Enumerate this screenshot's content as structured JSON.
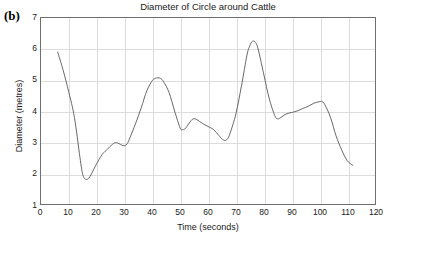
{
  "panel_label": "(b)",
  "chart_data": {
    "type": "line",
    "title": "Diameter of Circle around Cattle",
    "xlabel": "Time (seconds)",
    "ylabel": "Diameter (metres)",
    "xlim": [
      0,
      120
    ],
    "ylim": [
      1,
      7
    ],
    "xticks": [
      0,
      10,
      20,
      30,
      40,
      50,
      60,
      70,
      80,
      90,
      100,
      110,
      120
    ],
    "yticks": [
      1,
      2,
      3,
      4,
      5,
      6,
      7
    ],
    "grid": true,
    "legend": "none",
    "line_color": "#555555",
    "series": [
      {
        "name": "Diameter of circle around cattle",
        "x": [
          6,
          8,
          10,
          12,
          14,
          15,
          16,
          17,
          18,
          20,
          22,
          24,
          26,
          27,
          28,
          29,
          30,
          31,
          32,
          34,
          36,
          38,
          40,
          41,
          42,
          43,
          44,
          46,
          48,
          50,
          51,
          52,
          54,
          55,
          56,
          58,
          60,
          62,
          64,
          65,
          66,
          67,
          68,
          70,
          72,
          74,
          75,
          76,
          77,
          78,
          80,
          82,
          84,
          85,
          86,
          88,
          90,
          92,
          94,
          96,
          98,
          100,
          101,
          102,
          104,
          106,
          108,
          110,
          112
        ],
        "y": [
          5.9,
          5.3,
          4.6,
          3.8,
          2.5,
          1.95,
          1.8,
          1.82,
          1.95,
          2.3,
          2.6,
          2.78,
          2.95,
          2.98,
          2.95,
          2.9,
          2.88,
          2.95,
          3.15,
          3.6,
          4.1,
          4.65,
          4.98,
          5.05,
          5.07,
          5.05,
          4.95,
          4.6,
          4.0,
          3.45,
          3.4,
          3.45,
          3.7,
          3.75,
          3.72,
          3.6,
          3.5,
          3.4,
          3.2,
          3.1,
          3.05,
          3.1,
          3.3,
          3.9,
          4.8,
          5.8,
          6.1,
          6.25,
          6.22,
          6.0,
          5.2,
          4.4,
          3.85,
          3.75,
          3.78,
          3.9,
          3.95,
          4.0,
          4.08,
          4.15,
          4.25,
          4.3,
          4.3,
          4.2,
          3.8,
          3.2,
          2.75,
          2.4,
          2.25
        ]
      }
    ]
  }
}
